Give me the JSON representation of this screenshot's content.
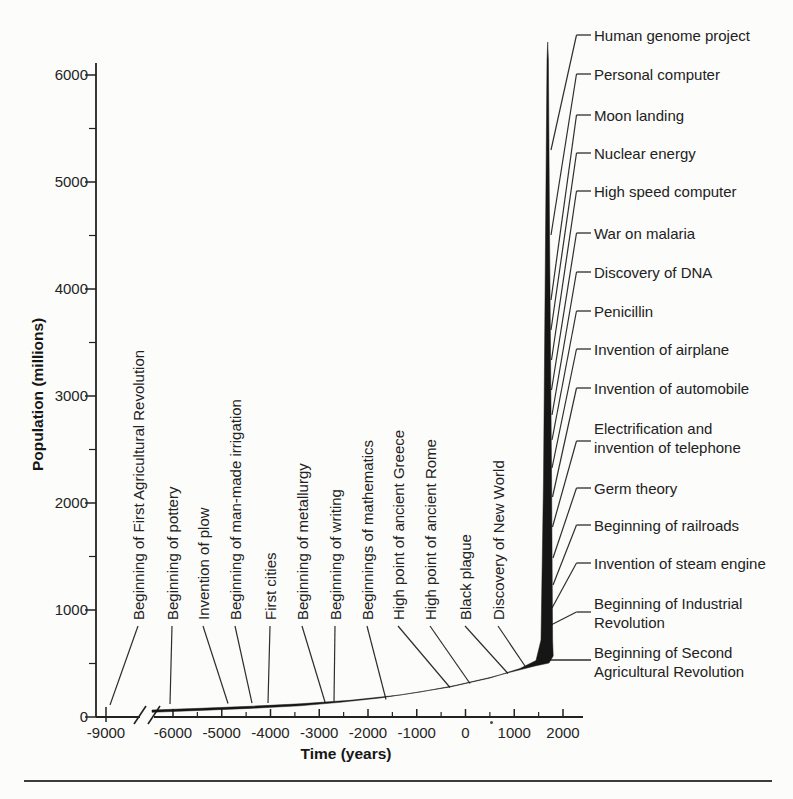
{
  "chart_data": {
    "type": "line",
    "xlabel": "Time (years)",
    "ylabel": "Population (millions)",
    "xlim": [
      -9500,
      2400
    ],
    "ylim": [
      0,
      6400
    ],
    "x_ticks": [
      -9000,
      -6000,
      -5000,
      -4000,
      -3000,
      -2000,
      -1000,
      0,
      1000,
      2000
    ],
    "y_ticks": [
      6000,
      5000,
      4000,
      3000,
      2000,
      1000,
      0
    ],
    "x_axis_break_between": [
      -9000,
      -6000
    ],
    "grid": false,
    "legend_position": "none",
    "series": [
      {
        "name": "World population",
        "x": [
          -9000,
          -6000,
          -5000,
          -4000,
          -3000,
          -2000,
          -1000,
          0,
          500,
          1000,
          1400,
          1650,
          1750,
          1800,
          1850,
          1900,
          1950,
          2000
        ],
        "y": [
          10,
          55,
          65,
          85,
          110,
          150,
          200,
          270,
          300,
          330,
          400,
          530,
          800,
          1000,
          1300,
          1700,
          2600,
          6200
        ]
      }
    ],
    "annotations_left": [
      "Beginning of First Agricultural Revolution",
      "Beginning of pottery",
      "Invention of plow",
      "Beginning of man-made irrigation",
      "First cities",
      "Beginning of metallurgy",
      "Beginning of writing",
      "Beginnings of mathematics",
      "High point of ancient Greece",
      "High point of ancient Rome",
      "Black plague",
      "Discovery of New World"
    ],
    "annotations_right": [
      "Human genome project",
      "Personal computer",
      "Moon landing",
      "Nuclear energy",
      "High speed computer",
      "War on malaria",
      "Discovery of DNA",
      "Penicillin",
      "Invention of airplane",
      "Invention of automobile",
      "Electrification and\ninvention of telephone",
      "Germ theory",
      "Beginning of railroads",
      "Invention of steam engine",
      "Beginning of Industrial\nRevolution",
      "Beginning of Second\nAgricultural Revolution"
    ],
    "ink_color": "#161616",
    "leader_color": "#2e2e2e"
  }
}
